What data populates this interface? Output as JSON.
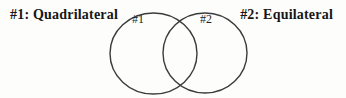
{
  "venn": {
    "set1": {
      "label": "#1: Quadrilateral",
      "circle_label": "#1"
    },
    "set2": {
      "label": "#2: Equilateral",
      "circle_label": "#2"
    }
  },
  "colors": {
    "stroke": "#3b3b3b",
    "text": "#161616",
    "background": "#fdfdfc"
  }
}
